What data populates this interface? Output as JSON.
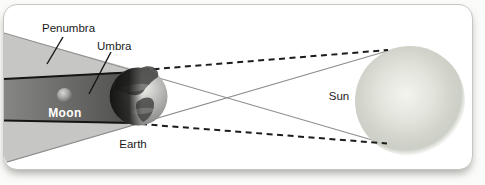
{
  "figure": {
    "type": "lunar-eclipse-shadow-diagram",
    "labels": {
      "penumbra": "Penumbra",
      "umbra": "Umbra",
      "moon": "Moon",
      "earth": "Earth",
      "sun": "Sun"
    },
    "colors": {
      "penumbra_fill": "#c6c6c4",
      "umbra_fill_light": "#858583",
      "umbra_fill_dark": "#4e4e4c",
      "edge_line_black": "#151515",
      "tangent_line_gray": "#8f8f8f",
      "dashed_ray_black": "#1c1c1c",
      "card_background": "#ffffff"
    }
  }
}
